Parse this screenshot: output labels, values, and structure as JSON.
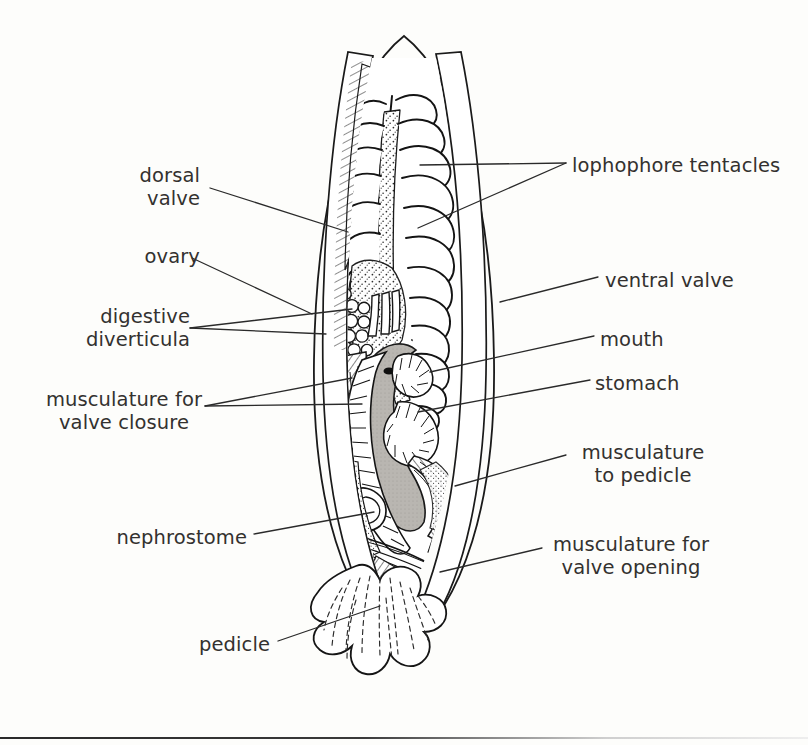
{
  "figure": {
    "background_color": "#fdfdfb",
    "ink_color": "#1a1a1a",
    "text_color": "#33312f",
    "stomach_fill": "#b9b6b1",
    "has_bottom_rule": true
  },
  "labels": [
    {
      "id": "dorsal-valve",
      "text": "dorsal\nvalve",
      "side": "left",
      "x": 200,
      "y": 163,
      "align": "right"
    },
    {
      "id": "ovary",
      "text": "ovary",
      "side": "left",
      "x": 200,
      "y": 244,
      "align": "right"
    },
    {
      "id": "digestive-diverticula",
      "text": "digestive\ndiverticula",
      "side": "left",
      "x": 200,
      "y": 304,
      "align": "right"
    },
    {
      "id": "musculature-valve-closure",
      "text": "musculature for\nvalve closure",
      "side": "left",
      "x": 200,
      "y": 388,
      "align": "right"
    },
    {
      "id": "nephrostome",
      "text": "nephrostome",
      "side": "left",
      "x": 247,
      "y": 525,
      "align": "right"
    },
    {
      "id": "pedicle",
      "text": "pedicle",
      "side": "left",
      "x": 270,
      "y": 632,
      "align": "right"
    },
    {
      "id": "lophophore-tentacles",
      "text": "lophophore tentacles",
      "side": "right",
      "x": 572,
      "y": 153,
      "align": "left"
    },
    {
      "id": "ventral-valve",
      "text": "ventral valve",
      "side": "right",
      "x": 605,
      "y": 268,
      "align": "left"
    },
    {
      "id": "mouth",
      "text": "mouth",
      "side": "right",
      "x": 600,
      "y": 327,
      "align": "left"
    },
    {
      "id": "stomach",
      "text": "stomach",
      "side": "right",
      "x": 595,
      "y": 371,
      "align": "left"
    },
    {
      "id": "musculature-to-pedicle",
      "text": "musculature\nto pedicle",
      "side": "right",
      "x": 573,
      "y": 440,
      "align": "left"
    },
    {
      "id": "musculature-valve-opening",
      "text": "musculature for\nvalve opening",
      "side": "right",
      "x": 548,
      "y": 532,
      "align": "left"
    }
  ],
  "leaders": [
    {
      "id": "leader-dorsal-valve",
      "points": "210,188 348,232"
    },
    {
      "id": "leader-ovary",
      "points": "192,258 310,312"
    },
    {
      "id": "leader-digestive-a",
      "points": "190,328 325,333"
    },
    {
      "id": "leader-digestive-b",
      "points": "190,328 352,309"
    },
    {
      "id": "leader-closure-a",
      "points": "205,406 352,378"
    },
    {
      "id": "leader-closure-b",
      "points": "205,406 360,404"
    },
    {
      "id": "leader-nephrostome",
      "points": "254,534 373,512"
    },
    {
      "id": "leader-pedicle",
      "points": "278,641 378,606"
    },
    {
      "id": "leader-lophophore-a",
      "points": "566,163 420,165"
    },
    {
      "id": "leader-lophophore-b",
      "points": "566,163 418,228"
    },
    {
      "id": "leader-ventral-valve",
      "points": "598,277 500,302"
    },
    {
      "id": "leader-mouth",
      "points": "594,336 430,372"
    },
    {
      "id": "leader-stomach",
      "points": "590,380 418,412"
    },
    {
      "id": "leader-musc-pedicle",
      "points": "566,455 455,486"
    },
    {
      "id": "leader-musc-opening",
      "points": "542,548 440,572"
    }
  ],
  "anatomy_parts": [
    "dorsal valve",
    "ventral valve",
    "lophophore tentacles",
    "ovary",
    "digestive diverticula",
    "mouth",
    "stomach",
    "nephrostome",
    "musculature for valve closure",
    "musculature for valve opening",
    "musculature to pedicle",
    "pedicle"
  ]
}
